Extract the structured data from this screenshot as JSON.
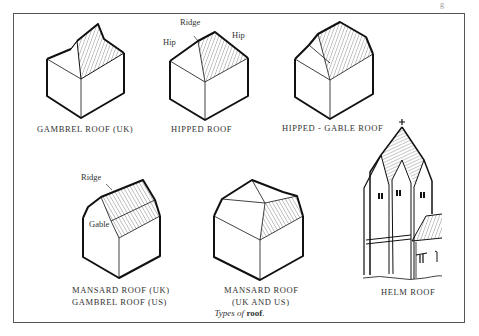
{
  "figure": {
    "caption_prefix": "Types of",
    "caption_bold": "roof",
    "caption_suffix": ".",
    "corner_mark": "g"
  },
  "roofs": [
    {
      "id": "gambrel-uk",
      "label": "GAMBREL ROOF (UK)"
    },
    {
      "id": "hipped",
      "label": "HIPPED ROOF",
      "annotations": [
        "Ridge",
        "Hip",
        "Hip"
      ]
    },
    {
      "id": "hipped-gable",
      "label": "HIPPED - GABLE ROOF"
    },
    {
      "id": "mansard-uk",
      "label_line1": "MANSARD ROOF (UK)",
      "label_line2": "GAMBREL ROOF (US)",
      "annotations": [
        "Ridge",
        "Gable"
      ]
    },
    {
      "id": "mansard-uk-us",
      "label_line1": "MANSARD ROOF",
      "label_line2": "(UK AND US)"
    },
    {
      "id": "helm",
      "label": "HELM ROOF"
    }
  ]
}
